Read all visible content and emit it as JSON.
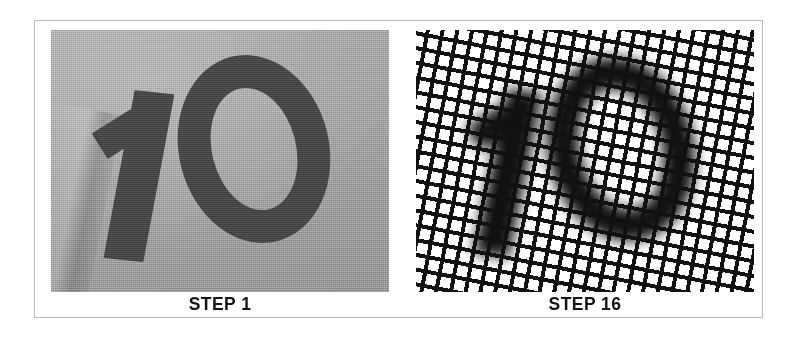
{
  "figure": {
    "background_color": "#ffffff",
    "frame_color": "#b9b9b9",
    "panels": [
      {
        "id": "step-1",
        "caption": "STEP 1",
        "photo_kind": "photograph-of-printed-numerals-on-gray-fabric",
        "subject_text": "10",
        "background_color": "#a2a2a2",
        "ink_color": "#3f3f3f",
        "description": "Close-up photograph of the numerals 1 and 0 printed in dark ink on light gray woven fabric, numerals tilted slightly, a fabric fold visible at the lower left."
      },
      {
        "id": "step-16",
        "caption": "STEP 16",
        "photo_kind": "same-numerals-seen-through-coarse-black-mesh-screen",
        "subject_text": "10",
        "background_color": "#ffffff",
        "ink_color": "#111111",
        "mesh_color": "#111111",
        "mesh_rotation_degrees": 11,
        "description": "The same numerals 10 viewed through a coarse black woven mesh screen rotated about eleven degrees, so the digits read as thickened dark clusters of grid cells."
      }
    ]
  }
}
